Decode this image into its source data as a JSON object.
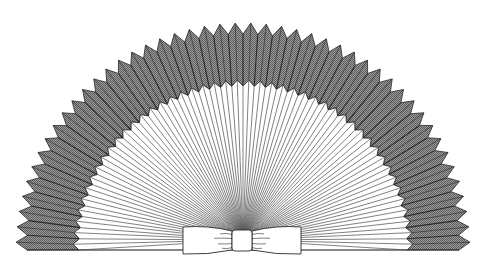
{
  "illustration": {
    "subject": "pleated paper fan with bow",
    "width": 486,
    "height": 268,
    "center": {
      "x": 243,
      "y": 250
    },
    "outer_radius_peak": 227,
    "outer_radius_valley": 216,
    "inner_radius_peak": 170,
    "inner_radius_valley": 164,
    "pleat_count": 46,
    "rib_count": 92,
    "colors": {
      "background": "#ffffff",
      "pleat_fill": "#8a8a8a",
      "pleat_hatch": "#5a5a5a",
      "line": "#2a2a2a",
      "rib": "#4a4a4a",
      "bow_fill": "#ffffff"
    },
    "bow": {
      "x": 183,
      "y": 227,
      "width": 118,
      "height": 27,
      "knot_x": 232,
      "knot_w": 20
    }
  }
}
